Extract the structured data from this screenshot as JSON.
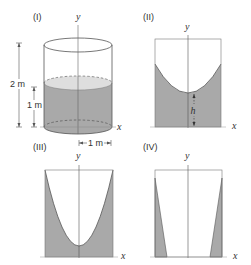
{
  "colors": {
    "water_fill": "#a9a9a9",
    "water_surface": "#dedede",
    "stroke": "#555555",
    "axis": "#666666"
  },
  "panels": [
    {
      "id": "I",
      "label": "(I)",
      "axis_y": "y",
      "axis_x": "x",
      "description": "Cylinder partially filled with water",
      "dimensions": {
        "height_label": "2 m",
        "water_level_label": "1 m",
        "radius_label": "1 m"
      }
    },
    {
      "id": "II",
      "label": "(II)",
      "axis_y": "y",
      "axis_x": "x",
      "description": "Rotating water surface, paraboloid with vertex above bottom",
      "dimensions": {
        "vertex_height_label": "h"
      }
    },
    {
      "id": "III",
      "label": "(III)",
      "axis_y": "y",
      "axis_x": "x",
      "description": "Paraboloid with vertex near the bottom"
    },
    {
      "id": "IV",
      "label": "(IV)",
      "axis_y": "y",
      "axis_x": "x",
      "description": "Paraboloid with vertex below the bottom, thin water wedges on walls"
    }
  ]
}
